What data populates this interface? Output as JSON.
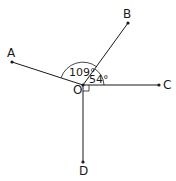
{
  "diagram": {
    "points": {
      "O": {
        "label": "O",
        "x": 83,
        "y": 85
      },
      "A": {
        "label": "A",
        "x": 12,
        "y": 62
      },
      "B": {
        "label": "B",
        "x": 128,
        "y": 23
      },
      "C": {
        "label": "C",
        "x": 159,
        "y": 85
      },
      "D": {
        "label": "D",
        "x": 83,
        "y": 162
      }
    },
    "angles": [
      {
        "name": "AOB",
        "label": "109°"
      },
      {
        "name": "BOC",
        "label": "54°"
      },
      {
        "name": "COD",
        "label": "right-angle"
      }
    ],
    "stroke_color": "#1a1a1a"
  }
}
